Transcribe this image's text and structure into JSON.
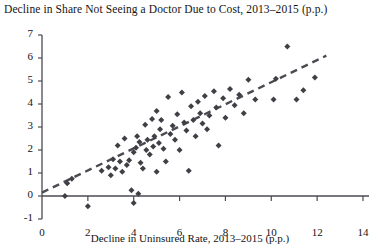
{
  "chart_data": {
    "type": "scatter",
    "title": "Decline in Share Not Seeing a Doctor Due to Cost, 2013–2015 (p.p.)",
    "xlabel": "Decline in Uninsured Rate, 2013–2015 (p.p.)",
    "ylabel": "",
    "xlim": [
      0,
      14
    ],
    "ylim": [
      -1,
      7
    ],
    "xticks": [
      0,
      2,
      4,
      6,
      8,
      10,
      12,
      14
    ],
    "yticks": [
      -1,
      0,
      1,
      2,
      3,
      4,
      5,
      6,
      7
    ],
    "grid": false,
    "legend": null,
    "marker": "diamond",
    "marker_color": "#3f3f46",
    "trendline": {
      "style": "dashed",
      "color": "#4a4a52",
      "x0": 0.0,
      "y0": 0.15,
      "x1": 12.4,
      "y1": 6.1
    },
    "points": [
      [
        1.0,
        0.0
      ],
      [
        1.1,
        0.55
      ],
      [
        1.3,
        0.75
      ],
      [
        2.0,
        -0.45
      ],
      [
        2.6,
        1.1
      ],
      [
        2.9,
        1.25
      ],
      [
        3.0,
        0.9
      ],
      [
        3.1,
        1.6
      ],
      [
        3.2,
        1.2
      ],
      [
        3.3,
        2.2
      ],
      [
        3.4,
        1.5
      ],
      [
        3.5,
        1.05
      ],
      [
        3.6,
        2.5
      ],
      [
        3.7,
        1.35
      ],
      [
        3.8,
        1.55
      ],
      [
        3.9,
        0.25
      ],
      [
        4.0,
        -0.3
      ],
      [
        4.0,
        1.9
      ],
      [
        4.1,
        2.1
      ],
      [
        4.15,
        2.6
      ],
      [
        4.2,
        0.1
      ],
      [
        4.25,
        2.35
      ],
      [
        4.3,
        1.45
      ],
      [
        4.4,
        1.2
      ],
      [
        4.5,
        3.1
      ],
      [
        4.55,
        2.0
      ],
      [
        4.6,
        2.45
      ],
      [
        4.7,
        1.8
      ],
      [
        4.8,
        3.35
      ],
      [
        4.85,
        2.15
      ],
      [
        4.9,
        2.6
      ],
      [
        5.0,
        1.05
      ],
      [
        5.0,
        3.7
      ],
      [
        5.1,
        2.3
      ],
      [
        5.15,
        2.9
      ],
      [
        5.2,
        3.3
      ],
      [
        5.3,
        2.05
      ],
      [
        5.4,
        1.5
      ],
      [
        5.5,
        4.3
      ],
      [
        5.6,
        2.7
      ],
      [
        5.7,
        3.05
      ],
      [
        5.8,
        2.45
      ],
      [
        5.9,
        3.55
      ],
      [
        6.0,
        2.0
      ],
      [
        6.1,
        4.5
      ],
      [
        6.2,
        3.2
      ],
      [
        6.3,
        2.85
      ],
      [
        6.4,
        1.1
      ],
      [
        6.5,
        3.9
      ],
      [
        6.6,
        3.3
      ],
      [
        6.7,
        2.6
      ],
      [
        6.8,
        4.1
      ],
      [
        6.9,
        3.6
      ],
      [
        7.0,
        3.15
      ],
      [
        7.1,
        4.35
      ],
      [
        7.2,
        2.9
      ],
      [
        7.3,
        3.5
      ],
      [
        7.5,
        4.55
      ],
      [
        7.6,
        3.85
      ],
      [
        7.7,
        2.2
      ],
      [
        7.9,
        4.25
      ],
      [
        8.0,
        3.4
      ],
      [
        8.2,
        4.65
      ],
      [
        8.4,
        3.95
      ],
      [
        8.6,
        4.4
      ],
      [
        8.8,
        3.6
      ],
      [
        9.0,
        5.05
      ],
      [
        9.3,
        4.2
      ],
      [
        10.1,
        4.2
      ],
      [
        10.2,
        5.1
      ],
      [
        10.7,
        6.5
      ],
      [
        11.1,
        4.2
      ],
      [
        11.4,
        4.6
      ],
      [
        11.9,
        5.15
      ]
    ]
  }
}
